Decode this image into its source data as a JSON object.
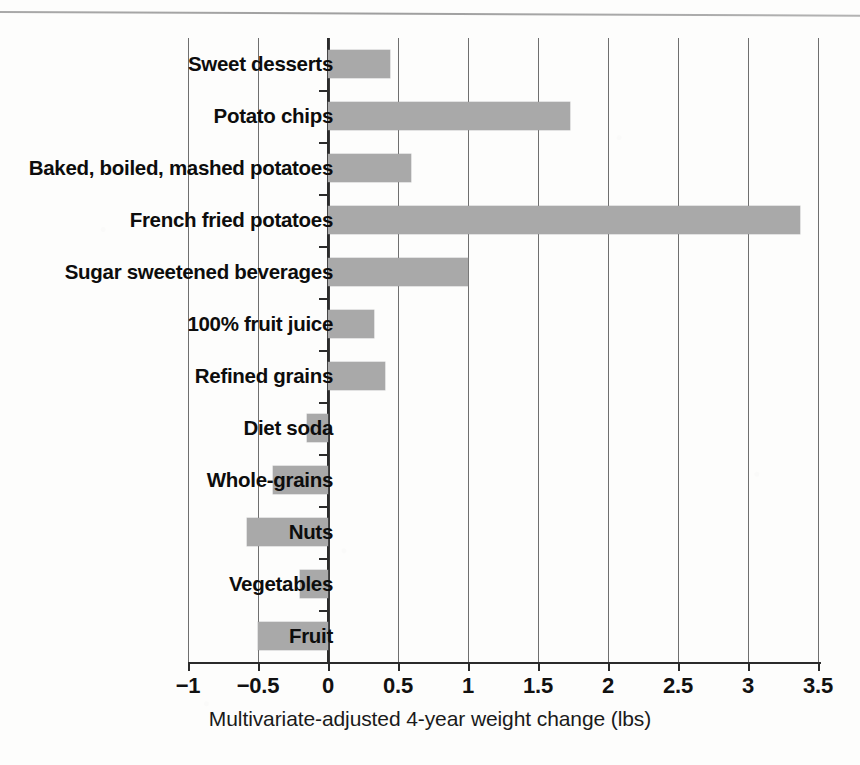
{
  "chart_data": {
    "type": "bar",
    "orientation": "horizontal",
    "title": "",
    "xlabel": "Multivariate-adjusted 4-year weight change (lbs)",
    "ylabel": "",
    "xlim": [
      -1,
      3.5
    ],
    "xticks": [
      "−1",
      "−0.5",
      "0",
      "0.5",
      "1",
      "1.5",
      "2",
      "2.5",
      "3",
      "3.5"
    ],
    "xtick_values": [
      -1,
      -0.5,
      0,
      0.5,
      1,
      1.5,
      2,
      2.5,
      3,
      3.5
    ],
    "grid": true,
    "grid_axis": "x",
    "legend": "none",
    "bar_color": "#a9a9a9",
    "categories": [
      "Sweet desserts",
      "Potato chips",
      "Baked, boiled, mashed potatoes",
      "French fried potatoes",
      "Sugar sweetened beverages",
      "100% fruit juice",
      "Refined grains",
      "Diet soda",
      "Whole-grains",
      "Nuts",
      "Vegetables",
      "Fruit"
    ],
    "values": [
      0.44,
      1.73,
      0.59,
      3.37,
      1.0,
      0.33,
      0.41,
      -0.15,
      -0.39,
      -0.58,
      -0.2,
      -0.5
    ]
  },
  "axis": {
    "x_title": "Multivariate-adjusted 4-year weight change (lbs)"
  }
}
